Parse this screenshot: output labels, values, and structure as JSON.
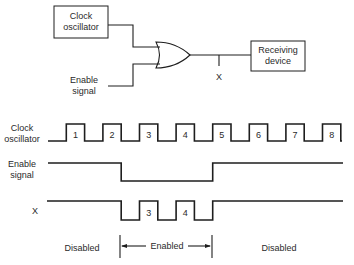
{
  "circuit": {
    "clock_box": {
      "line1": "Clock",
      "line2": "oscillator"
    },
    "enable_input": {
      "line1": "Enable",
      "line2": "signal"
    },
    "gate": "OR",
    "node_label": "X",
    "receiver_box": {
      "line1": "Receiving",
      "line2": "device"
    }
  },
  "timing": {
    "clock": {
      "label_line1": "Clock",
      "label_line2": "oscillator",
      "pulse_labels": [
        "1",
        "2",
        "3",
        "4",
        "5",
        "6",
        "7",
        "8"
      ],
      "levels": [
        0,
        1,
        0,
        1,
        0,
        1,
        0,
        1,
        0,
        1,
        0,
        1,
        0,
        1,
        0,
        1,
        0
      ]
    },
    "enable": {
      "label_line1": "Enable",
      "label_line2": "signal",
      "levels": [
        1,
        1,
        1,
        1,
        0,
        0,
        0,
        0,
        0,
        1,
        1,
        1,
        1,
        1,
        1,
        1,
        1
      ]
    },
    "x": {
      "label": "X",
      "pulse_labels": [
        "3",
        "4"
      ],
      "levels": [
        1,
        1,
        1,
        1,
        0,
        1,
        0,
        1,
        0,
        1,
        1,
        1,
        1,
        1,
        1,
        1,
        1
      ]
    },
    "regions": {
      "left": "Disabled",
      "middle": "Enabled",
      "right": "Disabled"
    }
  }
}
